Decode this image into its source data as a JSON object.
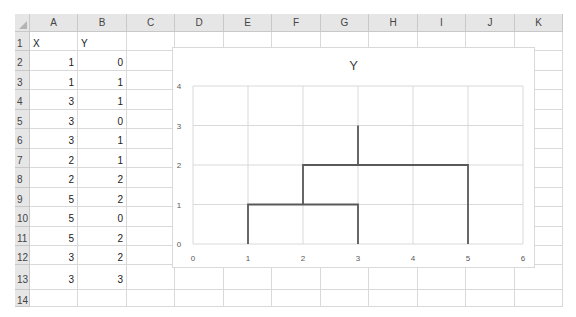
{
  "sheet": {
    "columns": [
      "A",
      "B",
      "C",
      "D",
      "E",
      "F",
      "G",
      "H",
      "I",
      "J",
      "K"
    ],
    "rows": [
      "1",
      "2",
      "3",
      "4",
      "5",
      "6",
      "7",
      "8",
      "9",
      "10",
      "11",
      "12",
      "13",
      "14"
    ],
    "cells": {
      "A1": "X",
      "B1": "Y",
      "A2": "1",
      "B2": "0",
      "A3": "1",
      "B3": "1",
      "A4": "3",
      "B4": "1",
      "A5": "3",
      "B5": "0",
      "A6": "3",
      "B6": "1",
      "A7": "2",
      "B7": "1",
      "A8": "2",
      "B8": "2",
      "A9": "5",
      "B9": "2",
      "A10": "5",
      "B10": "0",
      "A11": "5",
      "B11": "2",
      "A12": "3",
      "B12": "2",
      "A13": "3",
      "B13": "3"
    }
  },
  "chart": {
    "title": "Y",
    "x_ticks": [
      "0",
      "1",
      "2",
      "3",
      "4",
      "5",
      "6"
    ],
    "y_ticks": [
      "0",
      "1",
      "2",
      "3",
      "4"
    ],
    "line_color": "#595959",
    "grid_color": "#d9d9d9"
  },
  "chart_data": {
    "type": "scatter",
    "title": "Y",
    "xlabel": "",
    "ylabel": "",
    "xlim": [
      0,
      6
    ],
    "ylim": [
      0,
      4
    ],
    "grid": true,
    "legend": "none",
    "series": [
      {
        "name": "Y",
        "mode": "lines (scatter with straight lines, no markers)",
        "x": [
          1,
          1,
          3,
          3,
          3,
          2,
          2,
          5,
          5,
          5,
          3,
          3
        ],
        "y": [
          0,
          1,
          1,
          0,
          1,
          1,
          2,
          2,
          0,
          2,
          2,
          3
        ]
      }
    ]
  }
}
